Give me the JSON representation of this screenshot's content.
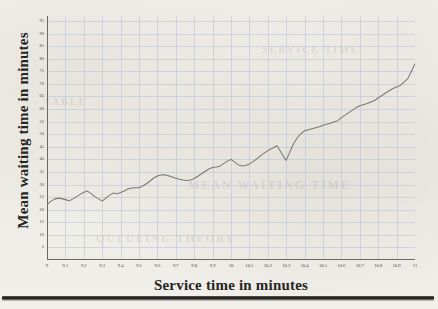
{
  "figure": {
    "xlabel": "Service time in minutes",
    "ylabel": "Mean waiting time in minutes"
  },
  "colors": {
    "grid": "#b9c6d6",
    "axis": "#6b6862",
    "line": "#7a7872",
    "text": "#262522",
    "page": "#f2f0eb",
    "rule": "#1c1b19"
  },
  "bleed_text": {
    "t1": "MEAN WAITING TIME",
    "t2": "QUEUEING THEORY",
    "t3": "SERVICE TIME",
    "t4": "TABLE"
  },
  "chart_data": {
    "type": "line",
    "title": "",
    "xlabel": "Service time in minutes",
    "ylabel": "Mean waiting time in minutes",
    "xlim": [
      9,
      11
    ],
    "ylim": [
      0,
      97
    ],
    "xticks": [
      "9",
      "9.1",
      "9.2",
      "9.3",
      "9.4",
      "9.5",
      "9.6",
      "9.7",
      "9.8",
      "9.9",
      "10",
      "10.1",
      "10.2",
      "10.3",
      "10.4",
      "10.5",
      "10.6",
      "10.7",
      "10.8",
      "10.9",
      "11"
    ],
    "yticks": [
      5,
      10,
      15,
      20,
      25,
      30,
      35,
      40,
      45,
      50,
      55,
      60,
      65,
      70,
      75,
      80,
      85,
      90,
      95
    ],
    "grid": true,
    "legend": false,
    "series": [
      {
        "name": "Mean waiting time",
        "x": [
          9.0,
          9.02,
          9.04,
          9.06,
          9.08,
          9.1,
          9.12,
          9.14,
          9.16,
          9.18,
          9.2,
          9.22,
          9.24,
          9.26,
          9.28,
          9.3,
          9.32,
          9.34,
          9.36,
          9.38,
          9.4,
          9.42,
          9.44,
          9.46,
          9.48,
          9.5,
          9.52,
          9.54,
          9.56,
          9.58,
          9.6,
          9.62,
          9.64,
          9.66,
          9.68,
          9.7,
          9.72,
          9.74,
          9.76,
          9.78,
          9.8,
          9.82,
          9.84,
          9.86,
          9.88,
          9.9,
          9.92,
          9.94,
          9.96,
          9.98,
          10.0,
          10.02,
          10.04,
          10.06,
          10.08,
          10.1,
          10.12,
          10.14,
          10.16,
          10.18,
          10.2,
          10.22,
          10.25,
          10.27,
          10.29,
          10.3,
          10.32,
          10.34,
          10.36,
          10.38,
          10.4,
          10.44,
          10.48,
          10.5,
          10.54,
          10.58,
          10.6,
          10.64,
          10.68,
          10.7,
          10.74,
          10.78,
          10.8,
          10.84,
          10.88,
          10.92,
          10.96,
          11.0
        ],
        "y": [
          22.0,
          23.3,
          24.2,
          24.6,
          24.4,
          24.0,
          23.6,
          24.2,
          25.2,
          26.1,
          26.9,
          27.4,
          26.4,
          25.2,
          24.3,
          23.4,
          24.6,
          25.8,
          26.6,
          26.3,
          26.8,
          27.4,
          28.2,
          28.6,
          28.7,
          28.7,
          29.4,
          30.3,
          31.4,
          32.6,
          33.4,
          33.8,
          33.9,
          33.5,
          33.0,
          32.5,
          32.1,
          31.8,
          31.6,
          31.8,
          32.4,
          33.3,
          34.3,
          35.3,
          36.2,
          36.8,
          37.0,
          37.3,
          38.3,
          39.3,
          40.0,
          38.9,
          37.8,
          37.4,
          37.6,
          38.2,
          39.1,
          40.2,
          41.4,
          42.5,
          43.5,
          44.2,
          45.4,
          43.0,
          40.6,
          39.6,
          43.0,
          46.2,
          48.6,
          50.2,
          51.4,
          52.2,
          53.0,
          53.6,
          54.4,
          55.4,
          56.6,
          58.6,
          60.6,
          61.3,
          62.2,
          63.4,
          64.4,
          66.4,
          68.2,
          69.4,
          72.0,
          78.0
        ]
      }
    ]
  }
}
